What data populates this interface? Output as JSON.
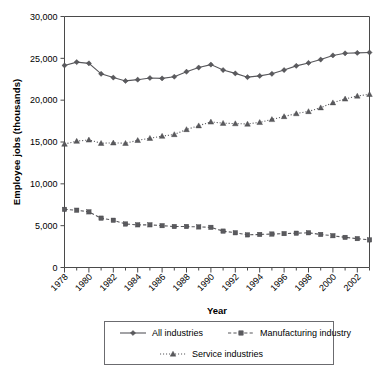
{
  "chart_data": {
    "type": "line",
    "title": "",
    "xlabel": "Year",
    "ylabel": "Employee jobs (thousands)",
    "xlim": [
      1978,
      2003
    ],
    "ylim": [
      0,
      30000
    ],
    "ytick_labels": [
      "30,000",
      "25,000",
      "20,000",
      "15,000",
      "10,000",
      "5,000",
      "0"
    ],
    "ytick_values": [
      30000,
      25000,
      20000,
      15000,
      10000,
      5000,
      0
    ],
    "xtick_labels": [
      "1978",
      "1980",
      "1982",
      "1984",
      "1986",
      "1988",
      "1990",
      "1992",
      "1994",
      "1996",
      "1998",
      "2000",
      "2002"
    ],
    "xtick_values": [
      1978,
      1980,
      1982,
      1984,
      1986,
      1988,
      1990,
      1992,
      1994,
      1996,
      1998,
      2000,
      2002
    ],
    "x": [
      1978,
      1979,
      1980,
      1981,
      1982,
      1983,
      1984,
      1985,
      1986,
      1987,
      1988,
      1989,
      1990,
      1991,
      1992,
      1993,
      1994,
      1995,
      1996,
      1997,
      1998,
      1999,
      2000,
      2001,
      2002,
      2003
    ],
    "grid": false,
    "legend_position": "bottom",
    "series": [
      {
        "name": "All industries",
        "marker": "diamond",
        "linestyle": "solid",
        "color": "#57575b",
        "values": [
          24150,
          24550,
          24400,
          23150,
          22700,
          22300,
          22450,
          22650,
          22600,
          22800,
          23400,
          23900,
          24250,
          23600,
          23200,
          22750,
          22900,
          23150,
          23600,
          24100,
          24450,
          24850,
          25350,
          25600,
          25650,
          25700
        ]
      },
      {
        "name": "Manufacturing industry",
        "marker": "square",
        "linestyle": "dashed",
        "color": "#57575b",
        "values": [
          6950,
          6850,
          6650,
          5900,
          5650,
          5200,
          5100,
          5100,
          5000,
          4900,
          4900,
          4850,
          4800,
          4350,
          4150,
          3900,
          3950,
          4000,
          4050,
          4100,
          4150,
          3950,
          3800,
          3600,
          3450,
          3300
        ]
      },
      {
        "name": "Service industries",
        "marker": "triangle",
        "linestyle": "dotted",
        "color": "#57575b",
        "values": [
          14750,
          15100,
          15250,
          14850,
          14900,
          14850,
          15200,
          15450,
          15700,
          15900,
          16500,
          16950,
          17400,
          17250,
          17200,
          17150,
          17350,
          17700,
          18050,
          18400,
          18650,
          19100,
          19700,
          20150,
          20500,
          20700
        ]
      }
    ]
  },
  "legend": {
    "items": [
      {
        "label": "All industries"
      },
      {
        "label": "Manufacturing industry"
      },
      {
        "label": "Service industries"
      }
    ]
  }
}
